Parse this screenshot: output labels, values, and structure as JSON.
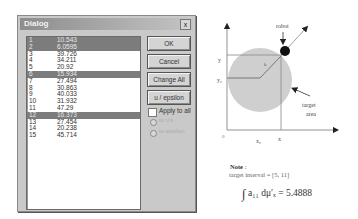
{
  "dialog": {
    "title": "Dialog",
    "close_label": "x",
    "list": [
      {
        "index": "1",
        "value": "10.543",
        "selected": true
      },
      {
        "index": "2",
        "value": "6.0595",
        "selected": true
      },
      {
        "index": "3",
        "value": "39.726",
        "selected": false
      },
      {
        "index": "4",
        "value": "34.211",
        "selected": false
      },
      {
        "index": "5",
        "value": "20.92",
        "selected": false
      },
      {
        "index": "6",
        "value": "15.934",
        "selected": true
      },
      {
        "index": "7",
        "value": "27.494",
        "selected": false
      },
      {
        "index": "8",
        "value": "30.863",
        "selected": false
      },
      {
        "index": "9",
        "value": "40.033",
        "selected": false
      },
      {
        "index": "10",
        "value": "31.932",
        "selected": false
      },
      {
        "index": "11",
        "value": "47.29",
        "selected": false
      },
      {
        "index": "12",
        "value": "16.373",
        "selected": true
      },
      {
        "index": "13",
        "value": "27.454",
        "selected": false
      },
      {
        "index": "14",
        "value": "20.238",
        "selected": false
      },
      {
        "index": "15",
        "value": "45.714",
        "selected": false
      }
    ],
    "buttons": {
      "ok": "OK",
      "cancel": "Cancel",
      "change_all": "Change All",
      "u_epsilon": "u / epsilon"
    },
    "apply_to_all": {
      "label": "Apply to all",
      "checked": false
    },
    "radios": [
      {
        "label": "to u's",
        "enabled": false,
        "selected": true
      },
      {
        "label": "to epsilon",
        "enabled": false,
        "selected": false
      }
    ]
  },
  "diagram": {
    "robot_label": "robot",
    "target_label_1": "target",
    "target_label_2": "area",
    "y_label": "y",
    "y0_label": "y₀",
    "x_label": "x",
    "x0_label": "x₀",
    "origin_label": "0",
    "circle_color": "#cfcfcf",
    "note_title": "Note",
    "note_colon": ":",
    "interval_text": "target interval = [5, 11]",
    "formula_lhs": "a₁₁ dμ′ₓ",
    "formula_rhs": "= 5.4888",
    "integral_sign": "∫"
  }
}
